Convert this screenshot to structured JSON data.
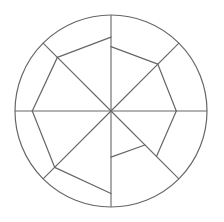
{
  "chart_data": {
    "type": "radar",
    "title": "",
    "axes_count": 8,
    "axes": [
      "N",
      "NE",
      "E",
      "SE",
      "S",
      "SW",
      "W",
      "NW"
    ],
    "rmax": 1.0,
    "grid": {
      "outer_circle": true,
      "spokes": 8
    },
    "segments": [
      {
        "from_axis": "NW",
        "from_r": 0.79,
        "to_axis": "N",
        "to_r": 0.77
      },
      {
        "from_axis": "N",
        "from_r": 0.67,
        "to_axis": "NE",
        "to_r": 0.69
      },
      {
        "from_axis": "NE",
        "from_r": 0.69,
        "to_axis": "E",
        "to_r": 0.68
      },
      {
        "from_axis": "E",
        "from_r": 0.68,
        "to_axis": "SE",
        "to_r": 0.67
      },
      {
        "from_axis": "SE",
        "from_r": 0.5,
        "to_axis": "S",
        "to_r": 0.48
      },
      {
        "from_axis": "S",
        "from_r": 0.86,
        "to_axis": "SW",
        "to_r": 0.83
      },
      {
        "from_axis": "SW",
        "from_r": 0.83,
        "to_axis": "W",
        "to_r": 0.82
      },
      {
        "from_axis": "W",
        "from_r": 0.82,
        "to_axis": "NW",
        "to_r": 0.79
      }
    ],
    "legend": [],
    "colors": {
      "line": "#666666",
      "grid": "#666666",
      "background": "#ffffff"
    }
  }
}
